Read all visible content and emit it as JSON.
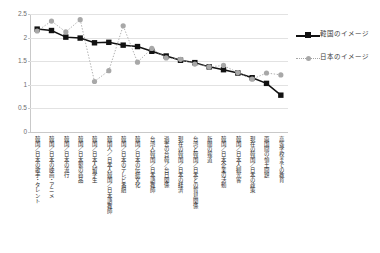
{
  "chart_data": {
    "type": "line",
    "title": "",
    "xlabel": "",
    "ylabel": "",
    "ylim": [
      0,
      2.5
    ],
    "ytick_labels": [
      "0",
      "0.5",
      "1",
      "1.5",
      "2",
      "2.5"
    ],
    "ytick_values": [
      0,
      0.5,
      1,
      1.5,
      2,
      2.5
    ],
    "grid": true,
    "legend_position": "right",
    "categories": [
      "韓国／日本の歌手・タレント",
      "韓国／日本の映画・アニメ",
      "韓国／日本の流行",
      "韓国／日本製の商品",
      "韓国／日本人留学生",
      "韓国人／日本人韓国／日本語教師",
      "韓国／日本のテレビ番組",
      "韓国／日本の伝統文化",
      "台湾人韓国／日本語教師",
      "過去の台韓／台日関係",
      "現在の韓国／日本の経済",
      "台湾と韓国／日本との貿易関係",
      "新聞の報道",
      "韓国／日本企業の活動",
      "韓国／日本人観光客",
      "現在の韓国／日本の政策",
      "両国間の領土問題",
      "高等学校までの教育"
    ],
    "series": [
      {
        "name": "韓国のイメージ",
        "marker": "square",
        "color": "#111111",
        "linestyle": "solid",
        "values": [
          2.18,
          2.15,
          2.01,
          1.99,
          1.89,
          1.9,
          1.84,
          1.81,
          1.71,
          1.61,
          1.52,
          1.47,
          1.38,
          1.32,
          1.25,
          1.15,
          1.03,
          0.78
        ]
      },
      {
        "name": "日本のイメージ",
        "marker": "circle",
        "color": "#a8a8a8",
        "linestyle": "dotted",
        "values": [
          2.14,
          2.35,
          2.12,
          2.38,
          1.07,
          1.3,
          2.25,
          1.48,
          1.77,
          1.57,
          1.54,
          1.44,
          1.38,
          1.41,
          1.26,
          1.12,
          1.25,
          1.21
        ]
      }
    ]
  },
  "legend": {
    "entries": [
      {
        "label": "韓国のイメージ",
        "key_name": "black-square-solid-line"
      },
      {
        "label": "日本のイメージ",
        "key_name": "gray-circle-dotted-line"
      }
    ]
  }
}
